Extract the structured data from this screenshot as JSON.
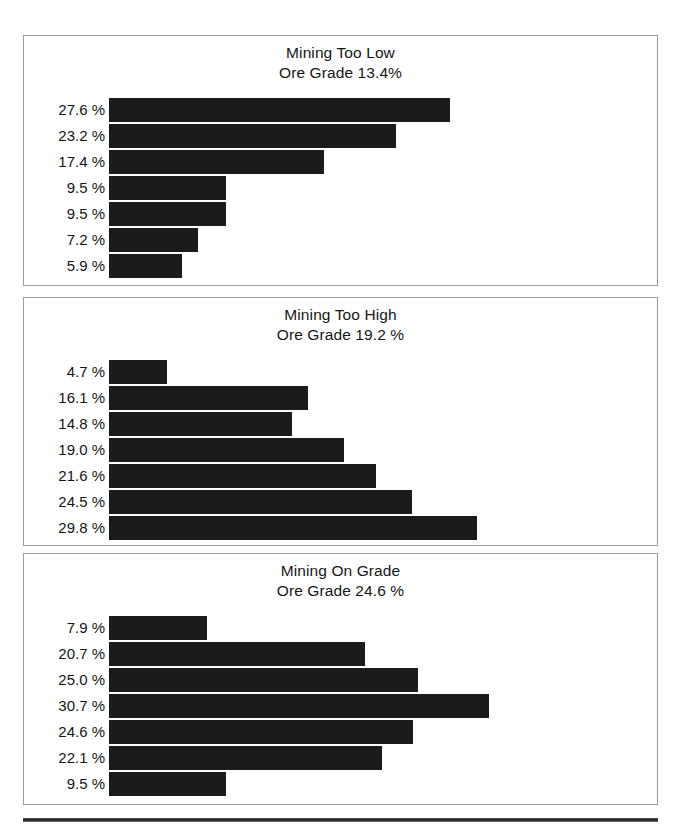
{
  "figure": {
    "bar_color": "#1b1b1b",
    "panel_border_color": "#9a9a9a",
    "rule_color": "#2a2a2a"
  },
  "chart_data": [
    {
      "type": "bar",
      "orientation": "horizontal",
      "title": "Mining Too Low",
      "subtitle": "Ore Grade 13.4%",
      "xlabel": "",
      "ylabel": "",
      "grid": false,
      "legend": null,
      "xlim": [
        0,
        44
      ],
      "categories": [
        "27.6 %",
        "23.2 %",
        "17.4 %",
        "9.5 %",
        "9.5 %",
        "7.2 %",
        "5.9 %"
      ],
      "values": [
        27.6,
        23.2,
        17.4,
        9.5,
        9.5,
        7.2,
        5.9
      ],
      "labels": [
        "27.6 %",
        "23.2 %",
        "17.4 %",
        "9.5 %",
        "9.5 %",
        "7.2 %",
        "5.9 %"
      ]
    },
    {
      "type": "bar",
      "orientation": "horizontal",
      "title": "Mining Too High",
      "subtitle": "Ore Grade 19.2 %",
      "xlabel": "",
      "ylabel": "",
      "grid": false,
      "legend": null,
      "xlim": [
        0,
        44
      ],
      "categories": [
        "4.7 %",
        "16.1 %",
        "14.8 %",
        "19.0 %",
        "21.6 %",
        "24.5 %",
        "29.8 %"
      ],
      "values": [
        4.7,
        16.1,
        14.8,
        19.0,
        21.6,
        24.5,
        29.8
      ],
      "labels": [
        "4.7 %",
        "16.1 %",
        "14.8 %",
        "19.0 %",
        "21.6 %",
        "24.5 %",
        "29.8 %"
      ]
    },
    {
      "type": "bar",
      "orientation": "horizontal",
      "title": "Mining On Grade",
      "subtitle": "Ore Grade 24.6 %",
      "xlabel": "",
      "ylabel": "",
      "grid": false,
      "legend": null,
      "xlim": [
        0,
        44
      ],
      "categories": [
        "7.9 %",
        "20.7 %",
        "25.0 %",
        "30.7 %",
        "24.6 %",
        "22.1 %",
        "9.5 %"
      ],
      "values": [
        7.9,
        20.7,
        25.0,
        30.7,
        24.6,
        22.1,
        9.5
      ],
      "labels": [
        "7.9 %",
        "20.7 %",
        "25.0 %",
        "30.7 %",
        "24.6 %",
        "22.1 %",
        "9.5 %"
      ]
    }
  ]
}
